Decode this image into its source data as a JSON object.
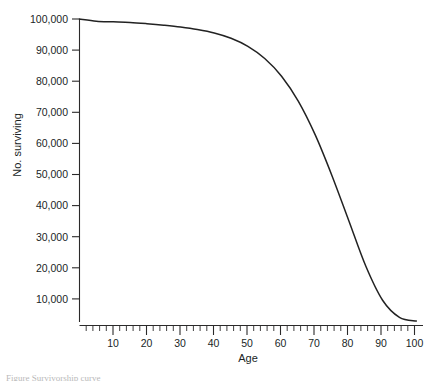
{
  "figure": {
    "caption_fragment": "Figure  Survivorship curve",
    "background_color": "#ffffff",
    "curve_color": "#222222",
    "axis_color": "#2b2a2a",
    "text_color": "#201f1f"
  },
  "chart_data": {
    "type": "line",
    "title": "",
    "subtitle": "",
    "xlabel": "Age",
    "ylabel": "No. surviving",
    "xlim": [
      0,
      102
    ],
    "ylim": [
      2500,
      100000
    ],
    "grid": false,
    "legend": null,
    "x_ticks_major": [
      10,
      20,
      30,
      40,
      50,
      60,
      70,
      80,
      90,
      100
    ],
    "x_tick_labels": [
      "10",
      "20",
      "30",
      "40",
      "50",
      "60",
      "70",
      "80",
      "90",
      "100"
    ],
    "x_tick_minor_step": 2,
    "y_ticks": [
      10000,
      20000,
      30000,
      40000,
      50000,
      60000,
      70000,
      80000,
      90000,
      100000
    ],
    "y_tick_labels": [
      "10,000",
      "20,000",
      "30,000",
      "40,000",
      "50,000",
      "60,000",
      "70,000",
      "80,000",
      "90,000",
      "100,000"
    ],
    "series": [
      {
        "name": "Number surviving",
        "x": [
          0,
          5,
          10,
          15,
          20,
          25,
          30,
          35,
          40,
          45,
          50,
          55,
          60,
          65,
          70,
          75,
          80,
          85,
          90,
          95,
          100
        ],
        "values": [
          100000,
          99300,
          99100,
          98900,
          98500,
          98000,
          97400,
          96600,
          95500,
          93800,
          91200,
          87300,
          81600,
          73500,
          62700,
          49500,
          35000,
          20500,
          9500,
          4000,
          2800
        ]
      }
    ]
  }
}
